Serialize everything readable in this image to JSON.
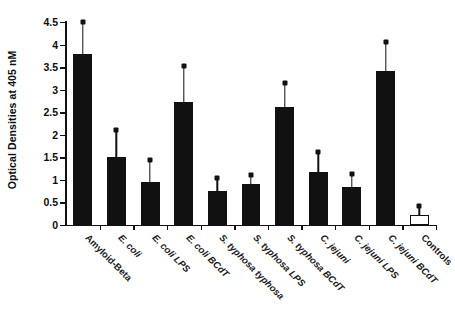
{
  "chart_data": {
    "type": "bar",
    "title": "",
    "xlabel": "",
    "ylabel": "Optical Densities at 405 nM",
    "ylim": [
      0,
      4.5
    ],
    "ytick_labels": [
      "0",
      "0.5",
      "1",
      "1.5",
      "2",
      "2.5",
      "3",
      "3.5",
      "4",
      "4.5"
    ],
    "ytick_values": [
      0,
      0.5,
      1,
      1.5,
      2,
      2.5,
      3,
      3.5,
      4,
      4.5
    ],
    "grid": false,
    "legend": "none",
    "bar_color": "#111111",
    "control_bar_color": "#ffffff",
    "categories": [
      "Amyloid-Beta",
      "E. coli",
      "E. coli LPS",
      "E. coli BCdT",
      "S. typhosa typhosa",
      "S. typhosa LPS",
      "S. typhosa BCdT",
      "C. jejuni",
      "C. jejuni LPS",
      "C. jejuni BCdT",
      "Controls"
    ],
    "values": [
      3.8,
      1.5,
      0.95,
      2.73,
      0.75,
      0.9,
      2.62,
      1.18,
      0.85,
      3.42,
      0.22
    ],
    "error_high": [
      4.5,
      2.1,
      1.45,
      3.52,
      1.05,
      1.1,
      3.15,
      1.62,
      1.12,
      4.05,
      0.42
    ],
    "errors": [
      0.7,
      0.6,
      0.5,
      0.79,
      0.3,
      0.2,
      0.53,
      0.44,
      0.27,
      0.63,
      0.2
    ],
    "styles": [
      "filled",
      "filled",
      "filled",
      "filled",
      "filled",
      "filled",
      "filled",
      "filled",
      "filled",
      "filled",
      "open"
    ]
  }
}
